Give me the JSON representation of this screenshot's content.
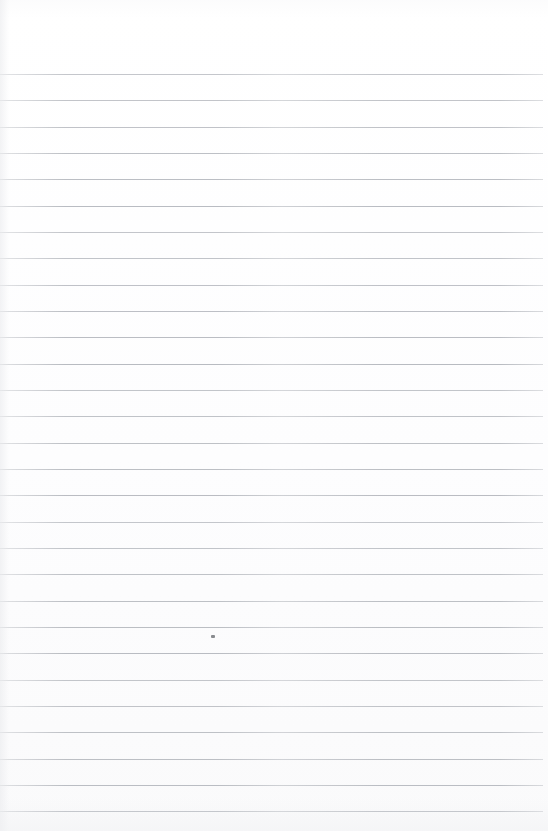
{
  "document": {
    "kind": "scanned-ruled-notebook-page",
    "title": "Blank lined paper scan",
    "page_width": 548,
    "page_height": 831,
    "paper_color": "#ffffff",
    "rule_color": "#b6b9bf",
    "text_content": "",
    "has_handwriting": false,
    "has_printed_text": false,
    "margins": {
      "top_blank_height": 74,
      "bottom_blank_height": 20,
      "left_inset": 0,
      "right_inset": 5
    },
    "ruling": {
      "first_line_y": 74,
      "line_spacing": 26.3,
      "line_thickness": 1,
      "line_count": 29,
      "line_start_x": 0,
      "line_end_x": 543,
      "line_y_positions": [
        74,
        100,
        127,
        153,
        179,
        206,
        232,
        258,
        285,
        311,
        337,
        364,
        390,
        416,
        443,
        469,
        495,
        522,
        548,
        574,
        601,
        627,
        653,
        680,
        706,
        732,
        759,
        785,
        811
      ]
    },
    "artifacts": [
      {
        "name": "ink-speck",
        "description": "small dark speck resting on a rule",
        "x": 211,
        "y": 635,
        "width": 4,
        "height": 3,
        "color": "#6f7176"
      }
    ]
  }
}
